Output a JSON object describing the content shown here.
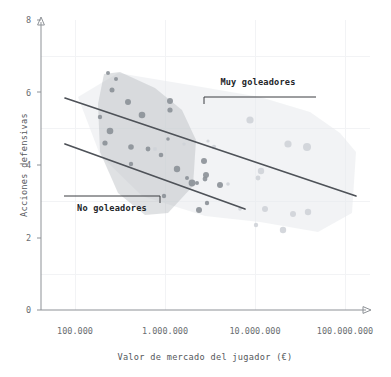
{
  "chart_data": {
    "type": "scatter",
    "title": "",
    "subtitle": "",
    "xlabel": "Valor de mercado del jugador (€)",
    "ylabel": "Acciones defensivas",
    "xscale": "log",
    "xlim": [
      100000,
      300000000
    ],
    "ylim": [
      0,
      8
    ],
    "grid": true,
    "legend_position": "none",
    "xticks": [
      {
        "value": 100000,
        "label": "100.000"
      },
      {
        "value": 1000000,
        "label": "1.000.000"
      },
      {
        "value": 10000000,
        "label": "10.000.000"
      },
      {
        "value": 100000000,
        "label": "100.000.000"
      }
    ],
    "yticks": [
      {
        "value": 0,
        "label": "0"
      },
      {
        "value": 2,
        "label": "2"
      },
      {
        "value": 4,
        "label": "4"
      },
      {
        "value": 6,
        "label": "6"
      },
      {
        "value": 8,
        "label": "8"
      }
    ],
    "annotations": [
      {
        "id": "muy-goleadores",
        "text": "Muy goleadores",
        "label_x": 258,
        "label_y": 85,
        "bracket": {
          "x1": 204,
          "y1": 97,
          "x2": 316,
          "y2": 97,
          "tick_side": "left",
          "tick_height": 7
        }
      },
      {
        "id": "no-goleadores",
        "text": "No goleadores",
        "label_x": 112,
        "label_y": 211,
        "bracket": {
          "x1": 64,
          "y1": 196,
          "x2": 160,
          "y2": 196,
          "tick_side": "right",
          "tick_height": 7
        }
      }
    ],
    "series": [
      {
        "name": "No goleadores",
        "color": "#8b9097",
        "fill_color": "#b9bdc2",
        "fill_opacity": 0.45,
        "hull": [
          [
            104,
            74
          ],
          [
            120,
            72
          ],
          [
            155,
            88
          ],
          [
            182,
            110
          ],
          [
            196,
            140
          ],
          [
            193,
            186
          ],
          [
            168,
            213
          ],
          [
            145,
            215
          ],
          [
            118,
            193
          ],
          [
            100,
            152
          ],
          [
            98,
            104
          ]
        ],
        "trend_line": {
          "x1": 65,
          "y1": 144,
          "x2": 245,
          "y2": 209,
          "equation_note": "linea de tendencia No goleadores"
        },
        "points": [
          {
            "x": 280000,
            "y": 6.7,
            "px": 108,
            "py": 73,
            "r": 2.0
          },
          {
            "x": 330000,
            "y": 6.5,
            "px": 116,
            "py": 79,
            "r": 2.0
          },
          {
            "x": 300000,
            "y": 6.15,
            "px": 112,
            "py": 90,
            "r": 2.5
          },
          {
            "x": 500000,
            "y": 5.75,
            "px": 128,
            "py": 102,
            "r": 3.0
          },
          {
            "x": 800000,
            "y": 5.35,
            "px": 142,
            "py": 115,
            "r": 3.3
          },
          {
            "x": 230000,
            "y": 5.3,
            "px": 100,
            "py": 117,
            "r": 2.2
          },
          {
            "x": 290000,
            "y": 4.85,
            "px": 110,
            "py": 131,
            "r": 3.3
          },
          {
            "x": 255000,
            "y": 4.5,
            "px": 105,
            "py": 143,
            "r": 2.6
          },
          {
            "x": 560000,
            "y": 4.35,
            "px": 131,
            "py": 147,
            "r": 2.8
          },
          {
            "x": 900000,
            "y": 4.3,
            "px": 148,
            "py": 149,
            "r": 2.4
          },
          {
            "x": 560000,
            "y": 3.85,
            "px": 131,
            "py": 164,
            "r": 2.2
          },
          {
            "x": 1800000,
            "y": 4.6,
            "px": 168,
            "py": 139,
            "r": 1.8
          },
          {
            "x": 2400000,
            "y": 3.75,
            "px": 177,
            "py": 169,
            "r": 3.2
          },
          {
            "x": 1450000,
            "y": 4.15,
            "px": 161,
            "py": 155,
            "r": 2.3
          },
          {
            "x": 4000000,
            "y": 3.3,
            "px": 192,
            "py": 183,
            "r": 3.4
          },
          {
            "x": 3300000,
            "y": 3.45,
            "px": 187,
            "py": 178,
            "r": 2.0
          },
          {
            "x": 4700000,
            "y": 3.3,
            "px": 197,
            "py": 183,
            "r": 2.0
          },
          {
            "x": 1600000,
            "y": 2.9,
            "px": 164,
            "py": 196,
            "r": 2.2
          },
          {
            "x": 5000000,
            "y": 2.45,
            "px": 199,
            "py": 210,
            "r": 3.0
          },
          {
            "x": 6300000,
            "y": 3.55,
            "px": 206,
            "py": 175,
            "r": 3.0
          },
          {
            "x": 6100000,
            "y": 3.45,
            "px": 205,
            "py": 179,
            "r": 2.4
          },
          {
            "x": 6600000,
            "y": 2.7,
            "px": 207,
            "py": 203,
            "r": 2.2
          },
          {
            "x": 9800000,
            "y": 3.25,
            "px": 220,
            "py": 185,
            "r": 3.0
          },
          {
            "x": 1900000,
            "y": 5.8,
            "px": 170,
            "py": 101,
            "r": 3.0
          },
          {
            "x": 1900000,
            "y": 5.55,
            "px": 170,
            "py": 110,
            "r": 2.6
          },
          {
            "x": 6000000,
            "y": 4.0,
            "px": 204,
            "py": 161,
            "r": 3.0
          }
        ]
      },
      {
        "name": "Muy goleadores",
        "color": "#cfd3d8",
        "fill_color": "#e7e9ec",
        "fill_opacity": 0.55,
        "hull": [
          [
            78,
            97
          ],
          [
            118,
            73
          ],
          [
            196,
            86
          ],
          [
            260,
            97
          ],
          [
            310,
            112
          ],
          [
            340,
            133
          ],
          [
            356,
            152
          ],
          [
            352,
            213
          ],
          [
            318,
            232
          ],
          [
            260,
            222
          ],
          [
            205,
            216
          ],
          [
            142,
            196
          ],
          [
            100,
            155
          ]
        ],
        "trend_line": {
          "x1": 65,
          "y1": 98,
          "x2": 356,
          "y2": 196,
          "equation_note": "linea de tendencia Muy goleadores"
        },
        "points": [
          {
            "x": 21000000,
            "y": 5.45,
            "px": 250,
            "py": 120,
            "r": 3.6
          },
          {
            "x": 53000000,
            "y": 4.75,
            "px": 288,
            "py": 144,
            "r": 3.6
          },
          {
            "x": 85000000,
            "y": 4.65,
            "px": 307,
            "py": 147,
            "r": 4.0
          },
          {
            "x": 30000000,
            "y": 3.95,
            "px": 261,
            "py": 171,
            "r": 3.2
          },
          {
            "x": 27000000,
            "y": 3.75,
            "px": 258,
            "py": 178,
            "r": 2.4
          },
          {
            "x": 34000000,
            "y": 2.85,
            "px": 265,
            "py": 209,
            "r": 3.0
          },
          {
            "x": 60000000,
            "y": 2.7,
            "px": 293,
            "py": 214,
            "r": 3.0
          },
          {
            "x": 86000000,
            "y": 2.75,
            "px": 308,
            "py": 212,
            "r": 3.2
          },
          {
            "x": 47000000,
            "y": 2.25,
            "px": 283,
            "py": 230,
            "r": 3.2
          },
          {
            "x": 26000000,
            "y": 2.4,
            "px": 256,
            "py": 225,
            "r": 2.2
          },
          {
            "x": 13000000,
            "y": 3.3,
            "px": 228,
            "py": 184,
            "r": 1.8
          },
          {
            "x": 8000000,
            "y": 4.35,
            "px": 214,
            "py": 147,
            "r": 2.2
          },
          {
            "x": 3000000,
            "y": 4.45,
            "px": 184,
            "py": 144,
            "r": 1.6
          },
          {
            "x": 1200000,
            "y": 4.3,
            "px": 155,
            "py": 149,
            "r": 2.0
          },
          {
            "x": 6800000,
            "y": 4.55,
            "px": 208,
            "py": 141,
            "r": 1.6
          },
          {
            "x": 16000000,
            "y": 2.55,
            "px": 240,
            "py": 209,
            "r": 1.8
          }
        ]
      }
    ]
  },
  "axes": {
    "y_title": "Acciones defensivas",
    "x_title": "Valor de mercado del jugador (€)"
  },
  "colors": {
    "axis": "#8d9196",
    "grid": "#f2f3f5",
    "trend": "#4e5258",
    "dark_points": "#8b9097",
    "light_points": "#cfd3d8",
    "text": "#55585c",
    "annotation_text": "#23262a",
    "background": "#ffffff"
  }
}
